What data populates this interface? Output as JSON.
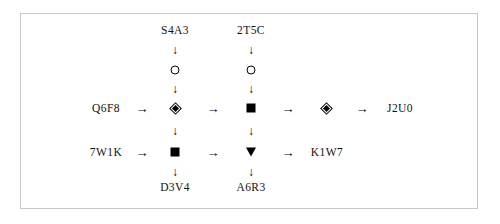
{
  "diagram": {
    "background_color": "#ffffff",
    "frame_color": "#c8c8c8",
    "node_color": "#000000",
    "text_color": "#111111",
    "labels": {
      "top_left": "S4A3",
      "top_right": "2T5C",
      "mid_left": "Q6F8",
      "mid_right": "J2U0",
      "low_left": "7W1K",
      "low_right": "K1W7",
      "bottom_left": "D3V4",
      "bottom_right": "A6R3"
    },
    "arrows": {
      "right": "→",
      "down": "↓"
    },
    "nodes": {
      "circle_c1": "circle-open",
      "circle_c2": "circle-open",
      "diamond_c1": "diamond-double",
      "square_c2": "square-filled",
      "diamond_c3": "diamond-double",
      "square_c1_low": "square-filled",
      "triangle_c2_low": "triangle-down"
    }
  }
}
